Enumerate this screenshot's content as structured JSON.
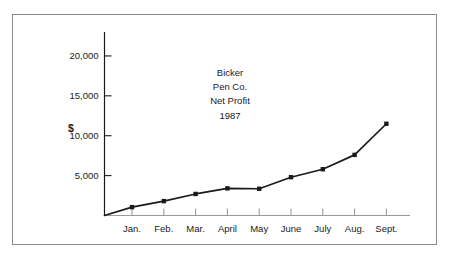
{
  "figure": {
    "border_color": "#8a8a8a",
    "background": "#ffffff",
    "ink_color": "#1a1a1a"
  },
  "axis_unit": "$",
  "title_lines": [
    "Bicker",
    "Pen Co.",
    "Net Profit",
    "1987"
  ],
  "chart_data": {
    "type": "line",
    "xlabel": "",
    "ylabel": "$",
    "categories": [
      "Jan.",
      "Feb.",
      "Mar.",
      "April",
      "May",
      "June",
      "July",
      "Aug.",
      "Sept."
    ],
    "values": [
      1050,
      1800,
      2700,
      3400,
      3350,
      4800,
      5800,
      7600,
      11500
    ],
    "y_ticks": [
      5000,
      10000,
      15000,
      20000
    ],
    "y_tick_labels": [
      "5,000",
      "10,000",
      "15,000",
      "20,000"
    ],
    "ylim": [
      0,
      23000
    ],
    "grid": false,
    "legend": null,
    "marker": "square",
    "line_color": "#1a1a1a",
    "series": [
      {
        "name": "Net Profit",
        "values": [
          1050,
          1800,
          2700,
          3400,
          3350,
          4800,
          5800,
          7600,
          11500
        ]
      }
    ]
  }
}
